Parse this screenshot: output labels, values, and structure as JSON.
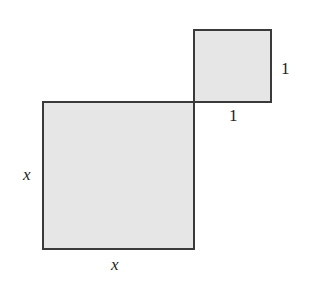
{
  "diagram": {
    "large_square": {
      "side_label_left": "x",
      "side_label_bottom": "x",
      "fill": "#e6e6e6",
      "stroke": "#3a3a3a"
    },
    "small_square": {
      "side_label_right": "1",
      "side_label_bottom": "1",
      "fill": "#e6e6e6",
      "stroke": "#3a3a3a"
    }
  }
}
